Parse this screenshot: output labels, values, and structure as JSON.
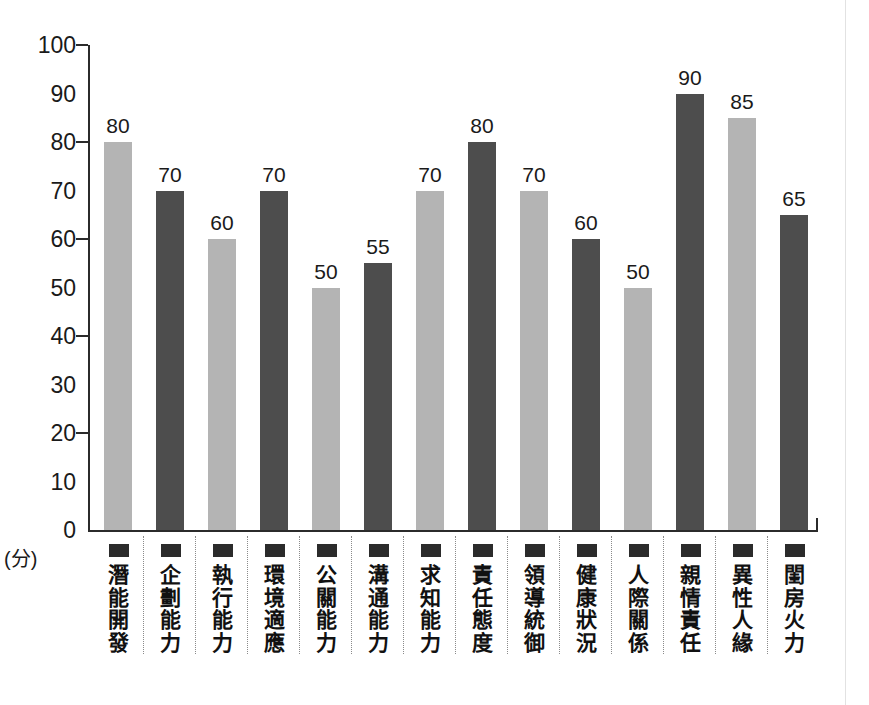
{
  "chart_data": {
    "type": "bar",
    "title": "",
    "subtitle": "",
    "xlabel": "",
    "ylabel": "",
    "unit_label": "(分)",
    "ylim": [
      0,
      100
    ],
    "ytick_step": 10,
    "ytick_mark_step": 20,
    "grid": false,
    "legend": "none",
    "yticks": [
      "100",
      "90",
      "80",
      "70",
      "60",
      "50",
      "40",
      "30",
      "20",
      "10",
      "0"
    ],
    "categories": [
      "潛能開發",
      "企劃能力",
      "執行能力",
      "環境適應",
      "公關能力",
      "溝通能力",
      "求知能力",
      "責任態度",
      "領導統御",
      "健康狀況",
      "人際關係",
      "親情責任",
      "異性人緣",
      "閨房火力"
    ],
    "values": [
      80,
      70,
      60,
      70,
      50,
      55,
      70,
      80,
      70,
      60,
      50,
      90,
      85,
      65
    ],
    "value_labels": [
      "80",
      "70",
      "60",
      "70",
      "50",
      "55",
      "70",
      "80",
      "70",
      "60",
      "50",
      "90",
      "85",
      "65"
    ],
    "bar_shades": [
      "light",
      "dark",
      "light",
      "dark",
      "light",
      "dark",
      "light",
      "dark",
      "light",
      "dark",
      "light",
      "dark",
      "light",
      "dark"
    ],
    "colors": {
      "light_bar": "#b4b4b4",
      "dark_bar": "#4d4d4d",
      "axis": "#2b2b2b",
      "text": "#1a1a1a",
      "separator": "#8a8a8a",
      "background": "#ffffff"
    }
  }
}
